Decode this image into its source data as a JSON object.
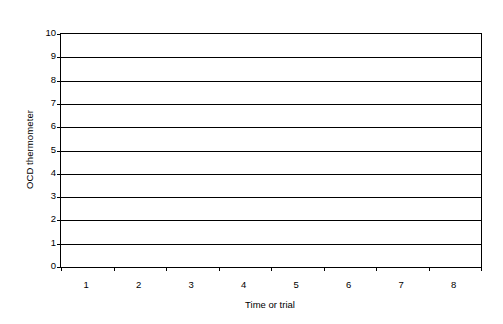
{
  "chart_data": {
    "type": "line",
    "title": "",
    "subtitle": "",
    "xlabel": "Time or trial",
    "ylabel": "OCD thermometer",
    "categories": [
      "1",
      "2",
      "3",
      "4",
      "5",
      "6",
      "7",
      "8"
    ],
    "series": [],
    "x": [
      1,
      2,
      3,
      4,
      5,
      6,
      7,
      8
    ],
    "xlim": [
      0.5,
      8.5
    ],
    "ylim": [
      0,
      10
    ],
    "y_ticks": [
      0,
      1,
      2,
      3,
      4,
      5,
      6,
      7,
      8,
      9,
      10
    ],
    "y_tick_labels": [
      "0",
      "1",
      "2",
      "3",
      "4",
      "5",
      "6",
      "7",
      "8",
      "9",
      "10"
    ],
    "y_tick_step": 1,
    "grid": true,
    "grid_axis": "y",
    "grid_color": "#000000",
    "legend": false,
    "legend_position": "none",
    "plot_background": "#ffffff",
    "frame_color": "#000000",
    "annotations": [],
    "data_labels": [],
    "note": "Empty chart template — no data series plotted"
  },
  "axes": {
    "y_title": "OCD thermometer",
    "x_title": "Time or trial",
    "y_labels": [
      "10",
      "9",
      "8",
      "7",
      "6",
      "5",
      "4",
      "3",
      "2",
      "1",
      "0"
    ],
    "x_labels": [
      "1",
      "2",
      "3",
      "4",
      "5",
      "6",
      "7",
      "8"
    ]
  }
}
